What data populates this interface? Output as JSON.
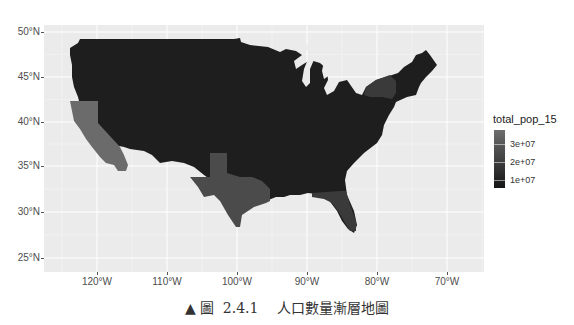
{
  "figure": {
    "caption_marker": "▲",
    "caption_label": "圖",
    "caption_number": "2.4.1",
    "caption_title": "人口數量漸層地圖"
  },
  "map": {
    "panel_background": "#ebebeb",
    "gridline_color": "#ffffff",
    "x_axis": {
      "ticks": [
        {
          "label": "120°W",
          "px": 97
        },
        {
          "label": "110°W",
          "px": 167
        },
        {
          "label": "100°W",
          "px": 237
        },
        {
          "label": "90°W",
          "px": 307
        },
        {
          "label": "80°W",
          "px": 377
        },
        {
          "label": "70°W",
          "px": 447
        }
      ]
    },
    "y_axis": {
      "ticks": [
        {
          "label": "50°N",
          "px": 32
        },
        {
          "label": "45°N",
          "px": 77
        },
        {
          "label": "40°N",
          "px": 122
        },
        {
          "label": "35°N",
          "px": 166
        },
        {
          "label": "30°N",
          "px": 212
        },
        {
          "label": "25°N",
          "px": 258
        }
      ]
    },
    "fills": {
      "low": "#1a1a1a",
      "base": "#1f1f1f",
      "mid": "#3a3a3a",
      "tx": "#4b4b4b",
      "high": "#6b6b6b"
    },
    "highlighted_states": [
      {
        "name": "California",
        "shade": "high"
      },
      {
        "name": "Texas",
        "shade": "tx"
      },
      {
        "name": "Florida",
        "shade": "mid"
      },
      {
        "name": "New York",
        "shade": "mid"
      }
    ]
  },
  "legend": {
    "title": "total_pop_15",
    "labels": [
      {
        "text": "3e+07",
        "offset": 14
      },
      {
        "text": "2e+07",
        "offset": 32
      },
      {
        "text": "1e+07",
        "offset": 50
      }
    ],
    "gradient_top": "#6e6e6e",
    "gradient_bottom": "#151515"
  }
}
